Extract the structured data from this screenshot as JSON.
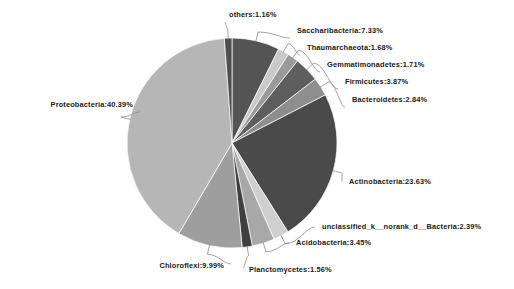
{
  "chart_data": {
    "type": "pie",
    "title": "",
    "units": "percent",
    "legend_position": "none",
    "label_format": "name:value%",
    "start_angle_deg": 0,
    "direction": "clockwise",
    "categories": [
      "Saccharibacteria",
      "Thaumarchaeota",
      "Gemmatimonadetes",
      "Firmicutes",
      "Bacteroidetes",
      "Actinobacteria",
      "unclassified_k__norank_d__Bacteria",
      "Acidobacteria",
      "Planctomycetes",
      "Chloroflexi",
      "Proteobacteria",
      "others"
    ],
    "values": [
      7.33,
      1.68,
      1.71,
      3.87,
      2.84,
      23.63,
      2.39,
      3.45,
      1.56,
      9.99,
      40.39,
      1.16
    ],
    "colors": [
      "#545454",
      "#c9c9c9",
      "#9a9a9a",
      "#5e5e5e",
      "#8e8e8e",
      "#4a4a4a",
      "#cfcfcf",
      "#a8a8a8",
      "#3f3f3f",
      "#9e9e9e",
      "#b6b6b6",
      "#4f4f4f"
    ],
    "slices": [
      {
        "name": "Saccharibacteria",
        "value": 7.33,
        "label": "Saccharibacteria:7.33%",
        "color": "#545454"
      },
      {
        "name": "Thaumarchaeota",
        "value": 1.68,
        "label": "Thaumarchaeota:1.68%",
        "color": "#c9c9c9"
      },
      {
        "name": "Gemmatimonadetes",
        "value": 1.71,
        "label": "Gemmatimonadetes:1.71%",
        "color": "#9a9a9a"
      },
      {
        "name": "Firmicutes",
        "value": 3.87,
        "label": "Firmicutes:3.87%",
        "color": "#5e5e5e"
      },
      {
        "name": "Bacteroidetes",
        "value": 2.84,
        "label": "Bacteroidetes:2.84%",
        "color": "#8e8e8e"
      },
      {
        "name": "Actinobacteria",
        "value": 23.63,
        "label": "Actinobacteria:23.63%",
        "color": "#4a4a4a"
      },
      {
        "name": "unclassified_k__norank_d__Bacteria",
        "value": 2.39,
        "label": "unclassified_k__norank_d__Bacteria:2.39%",
        "color": "#cfcfcf"
      },
      {
        "name": "Acidobacteria",
        "value": 3.45,
        "label": "Acidobacteria:3.45%",
        "color": "#a8a8a8"
      },
      {
        "name": "Planctomycetes",
        "value": 1.56,
        "label": "Planctomycetes:1.56%",
        "color": "#3f3f3f"
      },
      {
        "name": "Chloroflexi",
        "value": 9.99,
        "label": "Chloroflexi:9.99%",
        "color": "#9e9e9e"
      },
      {
        "name": "Proteobacteria",
        "value": 40.39,
        "label": "Proteobacteria:40.39%",
        "color": "#b6b6b6"
      },
      {
        "name": "others",
        "value": 1.16,
        "label": "others:1.16%",
        "color": "#4f4f4f"
      }
    ],
    "geometry": {
      "cx": 232,
      "cy": 143,
      "r": 105
    },
    "label_positions": [
      {
        "name": "others",
        "x": 229,
        "y": 17,
        "anchor": "start",
        "elbow_x": 225,
        "elbow_y": 22
      },
      {
        "name": "Saccharibacteria",
        "x": 297,
        "y": 33,
        "anchor": "start",
        "elbow_x": 290,
        "elbow_y": 38
      },
      {
        "name": "Thaumarchaeota",
        "x": 307,
        "y": 50,
        "anchor": "start",
        "elbow_x": 300,
        "elbow_y": 55
      },
      {
        "name": "Gemmatimonadetes",
        "x": 327,
        "y": 67,
        "anchor": "start",
        "elbow_x": 320,
        "elbow_y": 72
      },
      {
        "name": "Firmicutes",
        "x": 345,
        "y": 84,
        "anchor": "start",
        "elbow_x": 338,
        "elbow_y": 89
      },
      {
        "name": "Bacteroidetes",
        "x": 352,
        "y": 102,
        "anchor": "start",
        "elbow_x": 345,
        "elbow_y": 107
      },
      {
        "name": "Proteobacteria",
        "x": 133,
        "y": 107,
        "anchor": "end",
        "elbow_x": 140,
        "elbow_y": 112
      },
      {
        "name": "Actinobacteria",
        "x": 349,
        "y": 184,
        "anchor": "start",
        "elbow_x": 342,
        "elbow_y": 182
      },
      {
        "name": "unclassified_k__norank_d__Bacteria",
        "x": 322,
        "y": 229,
        "anchor": "start",
        "elbow_x": 315,
        "elbow_y": 227
      },
      {
        "name": "Acidobacteria",
        "x": 296,
        "y": 245,
        "anchor": "start",
        "elbow_x": 289,
        "elbow_y": 243
      },
      {
        "name": "Chloroflexi",
        "x": 224,
        "y": 268,
        "anchor": "end",
        "elbow_x": 231,
        "elbow_y": 264
      },
      {
        "name": "Planctomycetes",
        "x": 249,
        "y": 272,
        "anchor": "start",
        "elbow_x": 243,
        "elbow_y": 268
      }
    ]
  }
}
